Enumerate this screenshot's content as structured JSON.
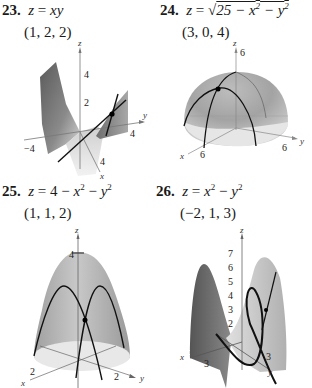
{
  "exercises": [
    {
      "number": "23.",
      "equation_parts": [
        "z",
        " = ",
        "xy"
      ],
      "point": "(1, 2, 2)",
      "plot": {
        "axes": {
          "x": "x",
          "y": "y",
          "z": "z"
        },
        "ticks": {
          "z": [
            "4",
            "2"
          ],
          "y_pos": "4",
          "y_neg": "−4",
          "x": "4"
        }
      }
    },
    {
      "number": "24.",
      "equation_parts": [
        "z",
        " = ",
        "√",
        "25 − x",
        "2",
        " − y",
        "2"
      ],
      "point": "(3, 0, 4)",
      "plot": {
        "axes": {
          "x": "x",
          "y": "y",
          "z": "z"
        },
        "ticks": {
          "z": "6",
          "x": "6",
          "y": "6"
        }
      }
    },
    {
      "number": "25.",
      "equation_parts": [
        "z",
        " = 4 − ",
        "x",
        "2",
        " − ",
        "y",
        "2"
      ],
      "point": "(1, 1, 2)",
      "plot": {
        "axes": {
          "x": "x",
          "y": "y",
          "z": "z"
        },
        "ticks": {
          "z": "4",
          "x": "2",
          "y": "2"
        }
      }
    },
    {
      "number": "26.",
      "equation_parts": [
        "z",
        " = ",
        "x",
        "2",
        " − ",
        "y",
        "2"
      ],
      "point": "(−2, 1, 3)",
      "plot": {
        "axes": {
          "x": "x",
          "y": "y",
          "z": "z"
        },
        "ticks": {
          "z": [
            "7",
            "6",
            "5",
            "4",
            "3",
            "2"
          ],
          "x": "3",
          "y": "3"
        }
      }
    }
  ]
}
